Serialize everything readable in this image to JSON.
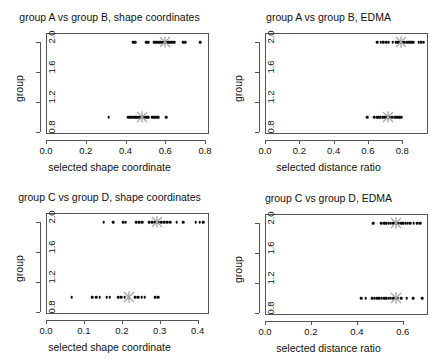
{
  "figure": {
    "width": 438,
    "height": 361,
    "background": "#ffffff",
    "point_color": "#0d0d0d",
    "mean_marker_color": "#a6a6a6",
    "axis_color": "#555555"
  },
  "chart_data": [
    {
      "type": "scatter",
      "panel": "top-left",
      "title": "group A vs group B, shape coordinates",
      "xlabel": "selected shape coordinate",
      "ylabel": "group",
      "xlim": [
        0.0,
        0.82
      ],
      "ylim": [
        0.78,
        2.12
      ],
      "xticks": [
        0.0,
        0.2,
        0.4,
        0.6,
        0.8
      ],
      "xticklabels": [
        "0.0",
        "0.2",
        "0.4",
        "0.6",
        "0.8"
      ],
      "yticks": [
        0.8,
        1.2,
        1.6,
        2.0
      ],
      "yticklabels": [
        "0.8",
        "1.2",
        "1.6",
        "2.0"
      ],
      "grid": false,
      "legend": "none",
      "series": [
        {
          "name": "group B (y = 2)",
          "y": 2,
          "mean": 0.6,
          "x": [
            0.438,
            0.448,
            0.505,
            0.515,
            0.545,
            0.555,
            0.565,
            0.575,
            0.585,
            0.592,
            0.6,
            0.608,
            0.615,
            0.622,
            0.63,
            0.638,
            0.645,
            0.69,
            0.7,
            0.775
          ]
        },
        {
          "name": "group A (y = 1)",
          "y": 1,
          "mean": 0.485,
          "x": [
            0.315,
            0.415,
            0.425,
            0.432,
            0.44,
            0.448,
            0.455,
            0.462,
            0.47,
            0.478,
            0.485,
            0.492,
            0.5,
            0.508,
            0.515,
            0.535,
            0.545,
            0.555,
            0.565,
            0.605
          ]
        }
      ]
    },
    {
      "type": "scatter",
      "panel": "top-right",
      "title": "group A vs group B, EDMA",
      "xlabel": "selected distance ratio",
      "ylabel": "group",
      "xlim": [
        0.0,
        0.95
      ],
      "ylim": [
        0.78,
        2.12
      ],
      "xticks": [
        0.0,
        0.2,
        0.4,
        0.6,
        0.8
      ],
      "xticklabels": [
        "0.0",
        "0.2",
        "0.4",
        "0.6",
        "0.8"
      ],
      "yticks": [
        0.8,
        1.2,
        1.6,
        2.0
      ],
      "yticklabels": [
        "0.8",
        "1.2",
        "1.6",
        "2.0"
      ],
      "grid": false,
      "legend": "none",
      "series": [
        {
          "name": "group B (y = 2)",
          "y": 2,
          "mean": 0.795,
          "x": [
            0.655,
            0.675,
            0.69,
            0.705,
            0.72,
            0.745,
            0.765,
            0.775,
            0.785,
            0.795,
            0.805,
            0.815,
            0.825,
            0.835,
            0.845,
            0.855,
            0.865,
            0.895,
            0.91,
            0.925
          ]
        },
        {
          "name": "group A (y = 1)",
          "y": 1,
          "mean": 0.715,
          "x": [
            0.595,
            0.635,
            0.65,
            0.66,
            0.672,
            0.685,
            0.695,
            0.705,
            0.715,
            0.725,
            0.74,
            0.755,
            0.765,
            0.775,
            0.785,
            0.795
          ]
        }
      ]
    },
    {
      "type": "scatter",
      "panel": "bottom-left",
      "title": "group C vs group D, shape coordinates",
      "xlabel": "selected shape coordinate",
      "ylabel": "group",
      "xlim": [
        0.0,
        0.43
      ],
      "ylim": [
        0.78,
        2.12
      ],
      "xticks": [
        0.0,
        0.1,
        0.2,
        0.3,
        0.4
      ],
      "xticklabels": [
        "0.0",
        "0.1",
        "0.2",
        "0.3",
        "0.4"
      ],
      "yticks": [
        0.8,
        1.2,
        1.6,
        2.0
      ],
      "yticklabels": [
        "0.8",
        "1.2",
        "1.6",
        "2.0"
      ],
      "grid": false,
      "legend": "none",
      "series": [
        {
          "name": "group D (y = 2)",
          "y": 2,
          "mean": 0.292,
          "x": [
            0.152,
            0.178,
            0.204,
            0.21,
            0.238,
            0.246,
            0.254,
            0.272,
            0.28,
            0.288,
            0.296,
            0.304,
            0.312,
            0.32,
            0.328,
            0.345,
            0.362,
            0.395,
            0.405,
            0.415
          ]
        },
        {
          "name": "group C (y = 1)",
          "y": 1,
          "mean": 0.218,
          "x": [
            0.068,
            0.122,
            0.132,
            0.142,
            0.16,
            0.168,
            0.19,
            0.198,
            0.208,
            0.218,
            0.236,
            0.244,
            0.252,
            0.26,
            0.288,
            0.296
          ]
        }
      ]
    },
    {
      "type": "scatter",
      "panel": "bottom-right",
      "title": "group C vs group D, EDMA",
      "xlabel": "selected distance ratio",
      "ylabel": "group",
      "xlim": [
        0.0,
        0.71
      ],
      "ylim": [
        0.78,
        2.12
      ],
      "xticks": [
        0.0,
        0.2,
        0.4,
        0.6
      ],
      "xticklabels": [
        "0.0",
        "0.2",
        "0.4",
        "0.6"
      ],
      "yticks": [
        0.8,
        1.2,
        1.6,
        2.0
      ],
      "yticklabels": [
        "0.8",
        "1.2",
        "1.6",
        "2.0"
      ],
      "grid": false,
      "legend": "none",
      "series": [
        {
          "name": "group D (y = 2)",
          "y": 2,
          "mean": 0.572,
          "x": [
            0.472,
            0.505,
            0.518,
            0.528,
            0.538,
            0.548,
            0.558,
            0.566,
            0.574,
            0.582,
            0.592,
            0.602,
            0.612,
            0.622,
            0.632,
            0.648,
            0.662,
            0.675
          ]
        },
        {
          "name": "group C (y = 1)",
          "y": 1,
          "mean": 0.572,
          "x": [
            0.418,
            0.438,
            0.468,
            0.478,
            0.488,
            0.498,
            0.508,
            0.518,
            0.528,
            0.538,
            0.548,
            0.558,
            0.568,
            0.578,
            0.592,
            0.618,
            0.645,
            0.685
          ]
        }
      ]
    }
  ]
}
